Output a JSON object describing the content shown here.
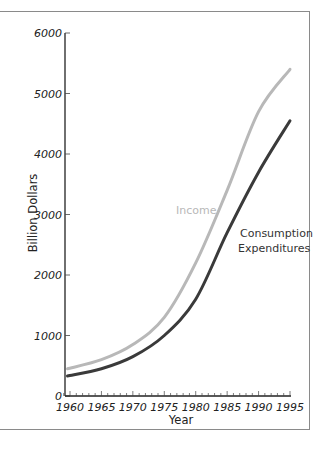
{
  "chart_data": {
    "type": "line",
    "title": "",
    "xlabel": "Year",
    "ylabel": "Billion Dollars",
    "x": [
      1960,
      1965,
      1970,
      1975,
      1980,
      1985,
      1990,
      1995
    ],
    "x_ticks": [
      "1960",
      "1965",
      "1970",
      "1975",
      "1980",
      "1985",
      "1990",
      "1995"
    ],
    "y_ticks": [
      "0",
      "1000",
      "2000",
      "3000",
      "4000",
      "5000",
      "6000"
    ],
    "xlim": [
      1959,
      1995
    ],
    "ylim": [
      0,
      6000
    ],
    "grid": false,
    "legend_position": "inline labels",
    "series": [
      {
        "name": "Income",
        "color": "#b8b8b8",
        "label_text": "Income",
        "values": [
          450,
          600,
          850,
          1300,
          2200,
          3400,
          4700,
          5400
        ]
      },
      {
        "name": "Consumption Expenditures",
        "color": "#3a3a3a",
        "label_lines": [
          "Consumption",
          "Expenditures"
        ],
        "values": [
          330,
          450,
          650,
          1000,
          1600,
          2700,
          3700,
          4550
        ]
      }
    ]
  }
}
